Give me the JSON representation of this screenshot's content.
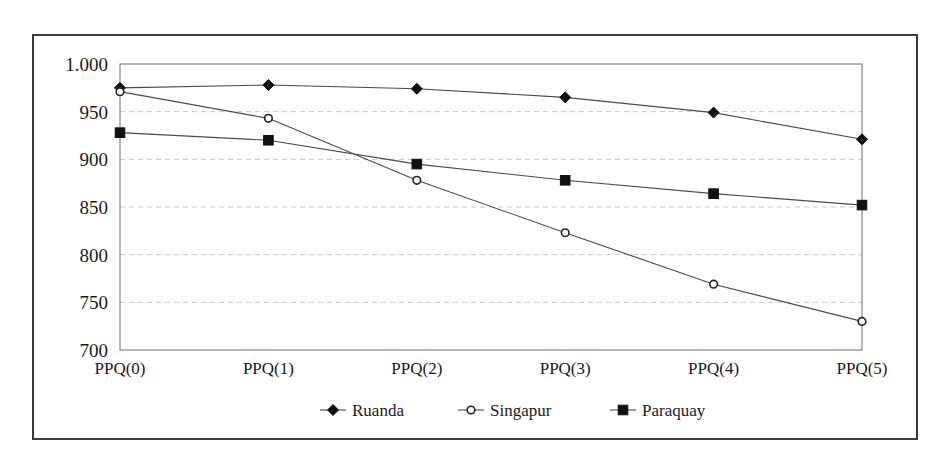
{
  "chart_data": {
    "type": "line",
    "title": "",
    "xlabel": "",
    "ylabel": "",
    "categories": [
      "PPQ(0)",
      "PPQ(1)",
      "PPQ(2)",
      "PPQ(3)",
      "PPQ(4)",
      "PPQ(5)"
    ],
    "ylim": [
      700,
      1000
    ],
    "ytick_values": [
      1000,
      950,
      900,
      850,
      800,
      750,
      700
    ],
    "ytick_labels": [
      "1.000",
      "950",
      "900",
      "850",
      "800",
      "750",
      "700"
    ],
    "grid": true,
    "grid_axis": "y",
    "legend_position": "bottom",
    "series": [
      {
        "name": "Ruanda",
        "marker": "filled-diamond",
        "color": "#111111",
        "values": [
          975,
          978,
          974,
          965,
          949,
          921
        ]
      },
      {
        "name": "Singapur",
        "marker": "open-circle",
        "color": "#222222",
        "values": [
          971,
          943,
          878,
          823,
          769,
          730
        ]
      },
      {
        "name": "Paraquay",
        "marker": "filled-square",
        "color": "#111111",
        "values": [
          928,
          920,
          895,
          878,
          864,
          852
        ]
      }
    ]
  },
  "figure": {
    "border_color": "#3a3a3a",
    "background": "#ffffff",
    "plot_frame_color": "#6e6e6e",
    "gridline_color": "#c9c9c9"
  }
}
